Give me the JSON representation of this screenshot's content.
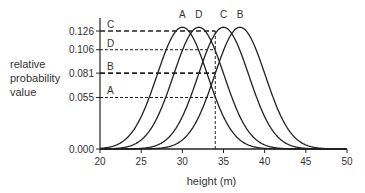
{
  "chart_data": {
    "type": "line",
    "title": "",
    "xlabel": "height (m)",
    "ylabel": "relative probability value",
    "xlim": [
      20,
      50
    ],
    "ylim": [
      0,
      0.13
    ],
    "x_ticks": [
      20,
      25,
      30,
      35,
      40,
      45,
      50
    ],
    "y_ticks": [
      0.0,
      0.055,
      0.081,
      0.106,
      0.126
    ],
    "y_tick_labels": [
      "0.000",
      "0.055",
      "0.081",
      "0.106",
      "0.126"
    ],
    "grid": false,
    "legend": "none (curves labeled at peaks)",
    "series": [
      {
        "name": "A",
        "distribution": "normal",
        "mean": 30,
        "value_at_34": 0.055
      },
      {
        "name": "D",
        "distribution": "normal",
        "mean": 32,
        "value_at_34": 0.106
      },
      {
        "name": "C",
        "distribution": "normal",
        "mean": 35,
        "value_at_34": 0.126
      },
      {
        "name": "B",
        "distribution": "normal",
        "mean": 37,
        "value_at_34": 0.081
      }
    ],
    "peak_value_approx": 0.13,
    "sd_approx": 3.07,
    "annotations": {
      "vertical_dashed_line_x": 34,
      "horizontal_dashed_lines": [
        {
          "label": "C",
          "y": 0.126
        },
        {
          "label": "D",
          "y": 0.106
        },
        {
          "label": "B",
          "y": 0.081
        },
        {
          "label": "A",
          "y": 0.055
        }
      ]
    }
  },
  "labels": {
    "ylabel_lines": [
      "relative",
      "probability",
      "value"
    ],
    "xlabel": "height (m)"
  }
}
